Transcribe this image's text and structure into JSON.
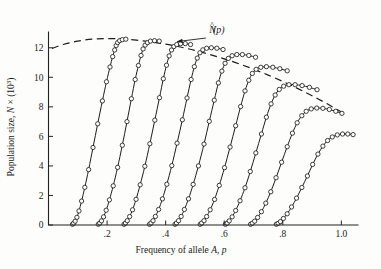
{
  "chart_data": {
    "type": "line",
    "title": "",
    "xlabel_parts": {
      "prefix": "Frequency of allele ",
      "italic_symbol": "A",
      "separator": ", ",
      "italic_var": "p"
    },
    "xlabel": "Frequency of allele A, p",
    "ylabel_parts": {
      "prefix": "Population size, ",
      "italic_symbol": "N",
      "times": " × (10",
      "exponent": "3",
      "suffix": ")"
    },
    "ylabel": "Population size, N × (10³)",
    "xlim": [
      0.0,
      1.05
    ],
    "ylim": [
      0,
      13.0
    ],
    "xticks": [
      0.2,
      0.4,
      0.6,
      0.8,
      1.0
    ],
    "xticklabels": [
      ".2",
      ".4",
      ".6",
      ".8",
      "1.0"
    ],
    "yticks": [
      0,
      2,
      4,
      6,
      8,
      10,
      12
    ],
    "yticklabels": [
      "0",
      "2",
      "4",
      "6",
      "8",
      "10",
      "12"
    ],
    "grid": false,
    "legend": "none",
    "annotations": [
      {
        "name": "equilibrium-envelope-label",
        "text": "N̂(p)",
        "text_base": "N",
        "text_tail": "(p)",
        "x": 0.575,
        "y": 13.1,
        "points_to_x": 0.425,
        "points_to_y": 12.35
      }
    ],
    "envelope": {
      "name": "N-hat-of-p",
      "style": "dashed",
      "description": "Equilibrium population size as a function of allele frequency",
      "x": [
        0.012,
        0.05,
        0.1,
        0.15,
        0.2,
        0.25,
        0.3,
        0.35,
        0.4,
        0.45,
        0.5,
        0.55,
        0.6,
        0.65,
        0.7,
        0.75,
        0.8,
        0.85,
        0.9,
        0.95,
        1.0
      ],
      "y": [
        11.95,
        12.22,
        12.45,
        12.58,
        12.62,
        12.6,
        12.52,
        12.4,
        12.25,
        12.05,
        11.82,
        11.55,
        11.25,
        10.92,
        10.55,
        10.15,
        9.72,
        9.25,
        8.75,
        8.22,
        7.65
      ]
    },
    "series": [
      {
        "name": "trajectory-1",
        "x": [
          0.082,
          0.086,
          0.091,
          0.097,
          0.104,
          0.113,
          0.124,
          0.137,
          0.152,
          0.168,
          0.184,
          0.198,
          0.21,
          0.219,
          0.226,
          0.231,
          0.236,
          0.243,
          0.252,
          0.264
        ],
        "y": [
          0.05,
          0.12,
          0.26,
          0.52,
          0.95,
          1.62,
          2.55,
          3.75,
          5.25,
          6.85,
          8.4,
          9.7,
          10.7,
          11.4,
          11.85,
          12.15,
          12.35,
          12.48,
          12.55,
          12.58
        ]
      },
      {
        "name": "trajectory-2",
        "x": [
          0.17,
          0.175,
          0.181,
          0.188,
          0.197,
          0.208,
          0.221,
          0.236,
          0.252,
          0.268,
          0.283,
          0.296,
          0.307,
          0.316,
          0.323,
          0.33,
          0.338,
          0.348,
          0.362,
          0.378
        ],
        "y": [
          0.05,
          0.13,
          0.28,
          0.55,
          1.0,
          1.7,
          2.65,
          3.9,
          5.4,
          7.0,
          8.55,
          9.85,
          10.8,
          11.48,
          11.92,
          12.18,
          12.35,
          12.45,
          12.48,
          12.45
        ]
      },
      {
        "name": "trajectory-3",
        "x": [
          0.258,
          0.263,
          0.269,
          0.277,
          0.287,
          0.299,
          0.313,
          0.329,
          0.346,
          0.363,
          0.379,
          0.392,
          0.403,
          0.412,
          0.42,
          0.428,
          0.438,
          0.451,
          0.467,
          0.485
        ],
        "y": [
          0.05,
          0.13,
          0.29,
          0.57,
          1.03,
          1.74,
          2.72,
          3.98,
          5.5,
          7.1,
          8.62,
          9.9,
          10.82,
          11.45,
          11.85,
          12.08,
          12.22,
          12.28,
          12.28,
          12.22
        ]
      },
      {
        "name": "trajectory-4",
        "x": [
          0.345,
          0.35,
          0.357,
          0.365,
          0.376,
          0.389,
          0.404,
          0.421,
          0.439,
          0.457,
          0.473,
          0.487,
          0.498,
          0.508,
          0.517,
          0.527,
          0.54,
          0.556,
          0.575,
          0.596
        ],
        "y": [
          0.05,
          0.13,
          0.29,
          0.58,
          1.05,
          1.77,
          2.76,
          4.02,
          5.54,
          7.12,
          8.6,
          9.85,
          10.72,
          11.3,
          11.66,
          11.86,
          11.97,
          12.0,
          11.97,
          11.88
        ]
      },
      {
        "name": "trajectory-5",
        "x": [
          0.432,
          0.437,
          0.444,
          0.453,
          0.464,
          0.478,
          0.494,
          0.512,
          0.531,
          0.549,
          0.566,
          0.58,
          0.592,
          0.603,
          0.614,
          0.627,
          0.643,
          0.662,
          0.684,
          0.707
        ],
        "y": [
          0.05,
          0.13,
          0.29,
          0.58,
          1.05,
          1.77,
          2.75,
          4.0,
          5.48,
          7.02,
          8.45,
          9.62,
          10.42,
          10.95,
          11.28,
          11.46,
          11.54,
          11.54,
          11.48,
          11.36
        ]
      },
      {
        "name": "trajectory-6",
        "x": [
          0.518,
          0.523,
          0.531,
          0.54,
          0.552,
          0.567,
          0.583,
          0.601,
          0.62,
          0.639,
          0.656,
          0.671,
          0.684,
          0.696,
          0.709,
          0.725,
          0.744,
          0.766,
          0.79,
          0.815
        ],
        "y": [
          0.05,
          0.13,
          0.29,
          0.57,
          1.03,
          1.73,
          2.68,
          3.88,
          5.28,
          6.72,
          8.02,
          9.08,
          9.8,
          10.26,
          10.54,
          10.68,
          10.72,
          10.68,
          10.58,
          10.44
        ]
      },
      {
        "name": "trajectory-7",
        "x": [
          0.604,
          0.61,
          0.617,
          0.627,
          0.639,
          0.654,
          0.671,
          0.689,
          0.708,
          0.727,
          0.744,
          0.76,
          0.774,
          0.788,
          0.803,
          0.821,
          0.842,
          0.866,
          0.891,
          0.917
        ],
        "y": [
          0.05,
          0.12,
          0.28,
          0.55,
          0.98,
          1.64,
          2.52,
          3.62,
          4.88,
          6.16,
          7.3,
          8.2,
          8.8,
          9.18,
          9.4,
          9.5,
          9.5,
          9.44,
          9.32,
          9.16
        ]
      },
      {
        "name": "trajectory-8",
        "x": [
          0.69,
          0.696,
          0.704,
          0.714,
          0.727,
          0.742,
          0.759,
          0.777,
          0.796,
          0.815,
          0.833,
          0.849,
          0.865,
          0.88,
          0.897,
          0.916,
          0.937,
          0.959,
          0.981,
          1.002
        ],
        "y": [
          0.05,
          0.12,
          0.26,
          0.51,
          0.9,
          1.48,
          2.25,
          3.2,
          4.25,
          5.3,
          6.22,
          6.92,
          7.4,
          7.7,
          7.86,
          7.92,
          7.9,
          7.82,
          7.7,
          7.56
        ]
      },
      {
        "name": "trajectory-9",
        "x": [
          0.778,
          0.784,
          0.792,
          0.802,
          0.815,
          0.83,
          0.847,
          0.865,
          0.884,
          0.902,
          0.92,
          0.937,
          0.953,
          0.969,
          0.986,
          1.004,
          1.022,
          1.04,
          1.056,
          1.07
        ],
        "y": [
          0.05,
          0.11,
          0.23,
          0.44,
          0.76,
          1.22,
          1.82,
          2.54,
          3.32,
          4.1,
          4.8,
          5.34,
          5.72,
          5.96,
          6.1,
          6.16,
          6.16,
          6.12,
          6.05,
          5.96
        ]
      }
    ]
  }
}
